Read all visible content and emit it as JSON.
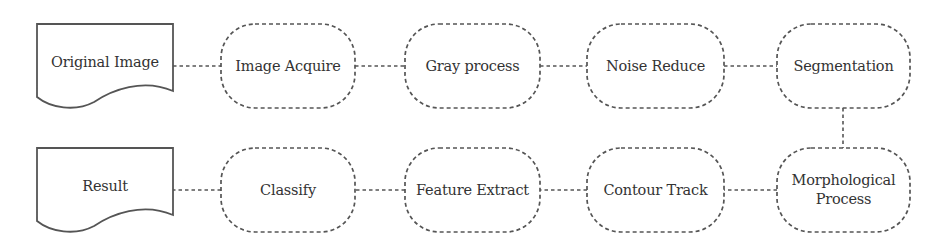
{
  "colors": {
    "stroke": "#555555",
    "text": "#333333",
    "background": "#ffffff"
  },
  "nodes": [
    {
      "id": "original-image",
      "label": "Original Image",
      "shape": "document",
      "x": 37,
      "y": 24,
      "w": 136,
      "h": 84
    },
    {
      "id": "image-acquire",
      "label": "Image Acquire",
      "shape": "pill",
      "x": 221,
      "y": 24,
      "w": 134,
      "h": 84
    },
    {
      "id": "gray-process",
      "label": "Gray process",
      "shape": "pill",
      "x": 405,
      "y": 24,
      "w": 135,
      "h": 84
    },
    {
      "id": "noise-reduce",
      "label": "Noise Reduce",
      "shape": "pill",
      "x": 587,
      "y": 24,
      "w": 137,
      "h": 84
    },
    {
      "id": "segmentation",
      "label": "Segmentation",
      "shape": "pill",
      "x": 777,
      "y": 24,
      "w": 133,
      "h": 84
    },
    {
      "id": "morphological-process",
      "label": "Morphological\nProcess",
      "shape": "pill",
      "x": 777,
      "y": 148,
      "w": 133,
      "h": 84
    },
    {
      "id": "contour-track",
      "label": "Contour Track",
      "shape": "pill",
      "x": 587,
      "y": 148,
      "w": 137,
      "h": 84
    },
    {
      "id": "feature-extract",
      "label": "Feature Extract",
      "shape": "pill",
      "x": 405,
      "y": 148,
      "w": 135,
      "h": 84
    },
    {
      "id": "classify",
      "label": "Classify",
      "shape": "pill",
      "x": 221,
      "y": 148,
      "w": 134,
      "h": 84
    },
    {
      "id": "result",
      "label": "Result",
      "shape": "document",
      "x": 37,
      "y": 148,
      "w": 136,
      "h": 84
    }
  ],
  "edges": [
    {
      "from": "original-image",
      "to": "image-acquire",
      "x1": 173,
      "y1": 66,
      "x2": 221,
      "y2": 66
    },
    {
      "from": "image-acquire",
      "to": "gray-process",
      "x1": 355,
      "y1": 66,
      "x2": 405,
      "y2": 66
    },
    {
      "from": "gray-process",
      "to": "noise-reduce",
      "x1": 540,
      "y1": 66,
      "x2": 587,
      "y2": 66
    },
    {
      "from": "noise-reduce",
      "to": "segmentation",
      "x1": 724,
      "y1": 66,
      "x2": 777,
      "y2": 66
    },
    {
      "from": "segmentation",
      "to": "morphological-process",
      "x1": 843,
      "y1": 108,
      "x2": 843,
      "y2": 148
    },
    {
      "from": "morphological-process",
      "to": "contour-track",
      "x1": 777,
      "y1": 190,
      "x2": 724,
      "y2": 190
    },
    {
      "from": "contour-track",
      "to": "feature-extract",
      "x1": 587,
      "y1": 190,
      "x2": 540,
      "y2": 190
    },
    {
      "from": "feature-extract",
      "to": "classify",
      "x1": 405,
      "y1": 190,
      "x2": 355,
      "y2": 190
    },
    {
      "from": "classify",
      "to": "result",
      "x1": 221,
      "y1": 190,
      "x2": 173,
      "y2": 190
    }
  ]
}
